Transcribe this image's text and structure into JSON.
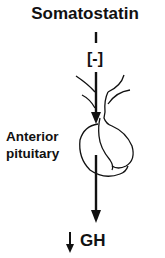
{
  "diagram": {
    "title": "Somatostatin",
    "inhibition_symbol": "[-]",
    "organ_label_line1": "Anterior",
    "organ_label_line2": "pituitary",
    "output_label": "GH",
    "output_direction": "decrease"
  },
  "icons": {
    "connector": "vertical-line",
    "arrow_into_pituitary": "down-arrow",
    "arrow_out_of_pituitary": "down-arrow",
    "output_change": "down-arrow"
  },
  "colors": {
    "stroke": "#111111",
    "background": "#ffffff"
  }
}
